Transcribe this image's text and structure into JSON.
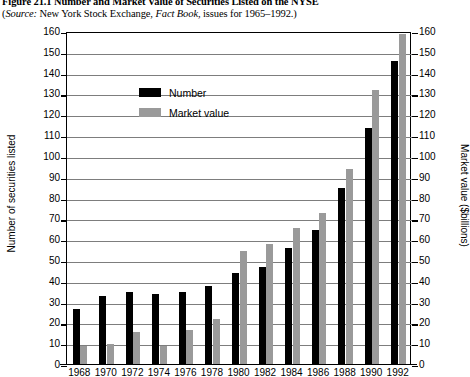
{
  "figure": {
    "title": "Figure 21.1  Number and Market Value of Securities Listed on the NYSE",
    "source_prefix": "Source:",
    "source_text": " New York Stock Exchange, ",
    "source_italic": "Fact Book",
    "source_suffix": ", issues for 1965–1992.)"
  },
  "legend": {
    "position": "inside-top-left",
    "items": [
      {
        "label": "Number",
        "color": "#000000",
        "key": "number"
      },
      {
        "label": "Market value",
        "color": "#9a9a9a",
        "key": "market_value"
      }
    ]
  },
  "chart_data": {
    "type": "bar",
    "title": "Number and Market Value of Securities Listed on the NYSE",
    "xlabel": "",
    "ylabel": "Number of securities listed",
    "y2label": "Market value ($billions)",
    "grid": true,
    "ylim": [
      0,
      160
    ],
    "y2lim": [
      0,
      160
    ],
    "yticks": [
      0,
      10,
      20,
      30,
      40,
      50,
      60,
      70,
      80,
      90,
      100,
      110,
      120,
      130,
      140,
      150,
      160
    ],
    "y2ticks": [
      0,
      10,
      20,
      30,
      40,
      50,
      60,
      70,
      80,
      90,
      100,
      110,
      120,
      130,
      140,
      150,
      160
    ],
    "categories": [
      "1968",
      "1970",
      "1972",
      "1974",
      "1976",
      "1978",
      "1980",
      "1982",
      "1984",
      "1986",
      "1988",
      "1990",
      "1992"
    ],
    "series": [
      {
        "name": "Number",
        "color": "#000000",
        "axis": "left",
        "values": [
          27,
          33,
          35,
          34,
          35,
          38,
          44,
          47,
          56,
          65,
          85,
          114,
          146
        ]
      },
      {
        "name": "Market value",
        "color": "#9a9a9a",
        "axis": "right",
        "values": [
          9,
          10,
          16,
          9,
          17,
          22,
          55,
          58,
          66,
          73,
          94,
          132,
          159
        ]
      }
    ]
  }
}
